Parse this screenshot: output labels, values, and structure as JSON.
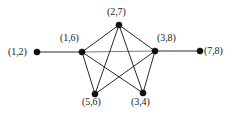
{
  "figure": {
    "background_color": "#ffffff",
    "edge_color": "#2a2a2a",
    "spine_edge_color": "#7a7a7a",
    "node_color": "#111111",
    "width": 233,
    "height": 114
  },
  "graph_data": {
    "type": "graph",
    "layout": "pentagon-with-two-pendants",
    "directed": false,
    "node_count": 7,
    "edge_count": 11,
    "nodes": [
      {
        "id": "n12",
        "label": "(1,2)",
        "x": 37,
        "y": 52,
        "label_x": 8,
        "label_y": 47,
        "label_anchor": "left-of-node"
      },
      {
        "id": "n16",
        "label": "(1,6)",
        "x": 82,
        "y": 52,
        "label_x": 60,
        "label_y": 33,
        "label_anchor": "above-left"
      },
      {
        "id": "n27",
        "label": "(2,7)",
        "x": 119,
        "y": 25,
        "label_x": 107,
        "label_y": 7,
        "label_anchor": "above"
      },
      {
        "id": "n38",
        "label": "(3,8)",
        "x": 155,
        "y": 51,
        "label_x": 157,
        "label_y": 33,
        "label_anchor": "above-right"
      },
      {
        "id": "n78",
        "label": "(7,8)",
        "x": 200,
        "y": 51,
        "label_x": 204,
        "label_y": 46,
        "label_anchor": "right-of-node"
      },
      {
        "id": "n56",
        "label": "(5,6)",
        "x": 95,
        "y": 94,
        "label_x": 82,
        "label_y": 97,
        "label_anchor": "below"
      },
      {
        "id": "n34",
        "label": "(3,4)",
        "x": 143,
        "y": 93,
        "label_x": 131,
        "label_y": 97,
        "label_anchor": "below"
      }
    ],
    "edges": [
      {
        "from": "n12",
        "to": "n16",
        "style": "plain"
      },
      {
        "from": "n38",
        "to": "n78",
        "style": "plain"
      },
      {
        "from": "n16",
        "to": "n38",
        "style": "spine"
      },
      {
        "from": "n16",
        "to": "n27",
        "style": "plain"
      },
      {
        "from": "n27",
        "to": "n38",
        "style": "plain"
      },
      {
        "from": "n16",
        "to": "n56",
        "style": "plain"
      },
      {
        "from": "n38",
        "to": "n34",
        "style": "plain"
      },
      {
        "from": "n27",
        "to": "n56",
        "style": "plain"
      },
      {
        "from": "n27",
        "to": "n34",
        "style": "plain"
      },
      {
        "from": "n16",
        "to": "n34",
        "style": "plain"
      },
      {
        "from": "n38",
        "to": "n56",
        "style": "plain"
      }
    ],
    "node_radius": 3.1
  }
}
